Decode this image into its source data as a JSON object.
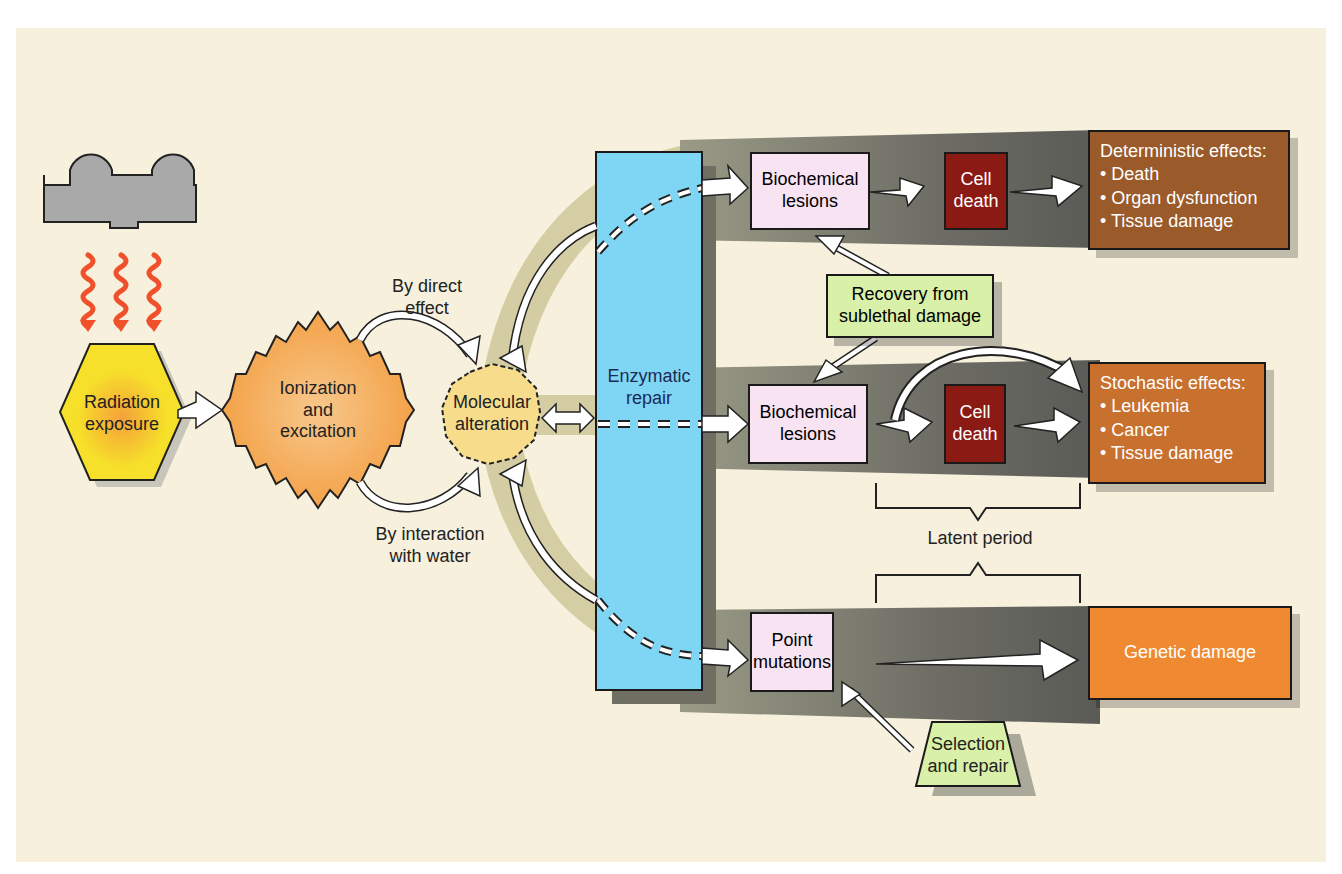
{
  "figure": {
    "nodes": {
      "radiation_exposure": {
        "label": "Radiation exposure",
        "color": "#f5e12a"
      },
      "ionization": {
        "label_lines": [
          "Ionization",
          "and",
          "excitation"
        ],
        "color": "#f5b160"
      },
      "molecular_alteration": {
        "label_lines": [
          "Molecular",
          "alteration"
        ],
        "color": "#f7dc8c"
      },
      "enzymatic_repair": {
        "label_lines": [
          "Enzymatic",
          "repair"
        ],
        "color": "#7fd6f4"
      },
      "biochemical_lesions_1": {
        "label_lines": [
          "Biochemical",
          "lesions"
        ],
        "color": "#f7e3f2"
      },
      "biochemical_lesions_2": {
        "label_lines": [
          "Biochemical",
          "lesions"
        ],
        "color": "#f7e3f2"
      },
      "point_mutations": {
        "label_lines": [
          "Point",
          "mutations"
        ],
        "color": "#f7e3f2"
      },
      "cell_death_1": {
        "label_lines": [
          "Cell",
          "death"
        ],
        "color": "#8b1a14"
      },
      "cell_death_2": {
        "label_lines": [
          "Cell",
          "death"
        ],
        "color": "#8b1a14"
      },
      "recovery": {
        "label_lines": [
          "Recovery from",
          "sublethal damage"
        ],
        "color": "#d8f0a8"
      },
      "selection_repair": {
        "label_lines": [
          "Selection",
          "and repair"
        ],
        "color": "#d8f0a8"
      },
      "deterministic": {
        "title": "Deterministic effects:",
        "items": [
          "Death",
          "Organ dysfunction",
          "Tissue damage"
        ],
        "color": "#9a5a2a"
      },
      "stochastic": {
        "title": "Stochastic effects:",
        "items": [
          "Leukemia",
          "Cancer",
          "Tissue damage"
        ],
        "color": "#c8702e"
      },
      "genetic_damage": {
        "label": "Genetic damage",
        "color": "#f08a32"
      }
    },
    "edge_labels": {
      "direct_effect": [
        "By direct",
        "effect"
      ],
      "interaction_water": [
        "By interaction",
        "with water"
      ],
      "latent_period": "Latent period"
    },
    "colors": {
      "background": "#f6f0dc",
      "band_gray": "#7a7a6e",
      "band_olive": "#cfc79a",
      "source_gray": "#a9a9a9",
      "wave_red": "#f0502a"
    }
  }
}
